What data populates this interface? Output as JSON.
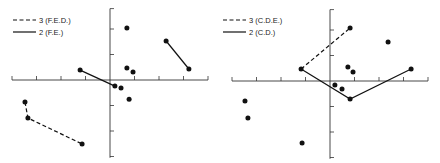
{
  "chart_data": [
    {
      "type": "scatter",
      "panel": "left",
      "title": "",
      "xlabel": "",
      "ylabel": "",
      "grid": false,
      "legend_position": "top-left",
      "axes": {
        "origin_px": [
          110,
          80
        ],
        "x_unit_px": 24.5,
        "y_unit_px": 25.5,
        "x_ticks": [
          -4,
          -3,
          -2,
          -1,
          1,
          2,
          3,
          4
        ],
        "y_ticks": [
          3,
          2,
          1,
          -1,
          -2,
          -3
        ],
        "xlim": [
          -4,
          4
        ],
        "ylim": [
          -3.05,
          2.8
        ]
      },
      "legend": [
        {
          "label": "3  (F.E.D.)",
          "style": "dashed"
        },
        {
          "label": "2  (F.E.)",
          "style": "solid"
        }
      ],
      "points": [
        {
          "x": 0.69,
          "y": 2.04
        },
        {
          "x": 2.29,
          "y": 1.53
        },
        {
          "x": 3.22,
          "y": 0.43
        },
        {
          "x": -1.22,
          "y": 0.39
        },
        {
          "x": 0.2,
          "y": -0.24
        },
        {
          "x": 0.69,
          "y": 0.47
        },
        {
          "x": 0.94,
          "y": 0.31
        },
        {
          "x": 0.45,
          "y": -0.31
        },
        {
          "x": 0.78,
          "y": -0.75
        },
        {
          "x": -3.47,
          "y": -0.86
        },
        {
          "x": -3.35,
          "y": -1.49
        },
        {
          "x": -1.14,
          "y": -2.51
        }
      ],
      "series": [
        {
          "name": "3 (F.E.D.)",
          "style": "dashed",
          "path": [
            [
              -3.47,
              -0.86
            ],
            [
              -3.35,
              -1.49
            ],
            [
              -1.14,
              -2.51
            ]
          ]
        },
        {
          "name": "2 (F.E.)",
          "style": "solid",
          "path": [
            [
              -1.22,
              0.39
            ],
            [
              0.2,
              -0.24
            ]
          ]
        },
        {
          "name": "2 (F.E.)",
          "style": "solid",
          "path": [
            [
              2.29,
              1.53
            ],
            [
              3.22,
              0.43
            ]
          ]
        }
      ]
    },
    {
      "type": "scatter",
      "panel": "right",
      "title": "",
      "xlabel": "",
      "ylabel": "",
      "grid": false,
      "legend_position": "top-left",
      "axes": {
        "origin_px": [
          330,
          81
        ],
        "x_unit_px": 24.5,
        "y_unit_px": 25.5,
        "x_ticks": [
          -4,
          -3,
          -2,
          -1,
          1,
          2,
          3,
          4
        ],
        "y_ticks": [
          3,
          2,
          1,
          -1,
          -2,
          -3
        ],
        "xlim": [
          -4,
          4
        ],
        "ylim": [
          -3.05,
          2.8
        ]
      },
      "legend": [
        {
          "label": "3 (C.D.E.)",
          "style": "dashed"
        },
        {
          "label": "2 (C.D.)",
          "style": "solid"
        }
      ],
      "points": [
        {
          "x": 0.82,
          "y": 2.08
        },
        {
          "x": -1.18,
          "y": 0.47
        },
        {
          "x": 0.73,
          "y": 0.55
        },
        {
          "x": 0.94,
          "y": 0.35
        },
        {
          "x": 0.2,
          "y": -0.16
        },
        {
          "x": 0.49,
          "y": -0.31
        },
        {
          "x": 0.82,
          "y": -0.71
        },
        {
          "x": 2.37,
          "y": 1.53
        },
        {
          "x": 3.31,
          "y": 0.47
        },
        {
          "x": -3.47,
          "y": -0.78
        },
        {
          "x": -3.35,
          "y": -1.45
        },
        {
          "x": -1.14,
          "y": -2.43
        }
      ],
      "series": [
        {
          "name": "3 (C.D.E.)",
          "style": "dashed",
          "path": [
            [
              -1.18,
              0.47
            ],
            [
              0.82,
              2.08
            ]
          ]
        },
        {
          "name": "2 (C.D.)",
          "style": "solid",
          "path": [
            [
              -1.18,
              0.47
            ],
            [
              0.82,
              -0.71
            ],
            [
              3.31,
              0.47
            ]
          ]
        }
      ]
    }
  ],
  "colors": {
    "ink": "#111111",
    "axis": "#333333",
    "background": "#ffffff"
  }
}
